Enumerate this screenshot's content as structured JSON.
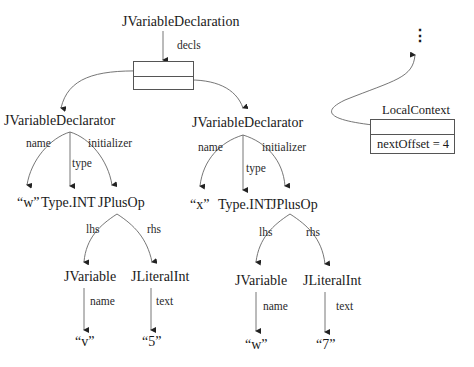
{
  "diagram": {
    "root": {
      "label": "JVariableDeclaration",
      "decls_edge": "decls"
    },
    "declarators": [
      {
        "label": "JVariableDeclarator",
        "edges": {
          "name": "name",
          "type": "type",
          "initializer": "initializer"
        },
        "name_value": "“w”",
        "type_value": "Type.INT",
        "initializer": {
          "label": "JPlusOp",
          "edges": {
            "lhs": "lhs",
            "rhs": "rhs"
          },
          "lhs": {
            "label": "JVariable",
            "edge": "name",
            "value": "“v”"
          },
          "rhs": {
            "label": "JLiteralInt",
            "edge": "text",
            "value": "“5”"
          }
        }
      },
      {
        "label": "JVariableDeclarator",
        "edges": {
          "name": "name",
          "type": "type",
          "initializer": "initializer"
        },
        "name_value": "“x”",
        "type_value": "Type.INT",
        "initializer": {
          "label": "JPlusOp",
          "edges": {
            "lhs": "lhs",
            "rhs": "rhs"
          },
          "lhs": {
            "label": "JVariable",
            "edge": "name",
            "value": "“w”"
          },
          "rhs": {
            "label": "JLiteralInt",
            "edge": "text",
            "value": "“7”"
          }
        }
      }
    ],
    "local_context": {
      "title": "LocalContext",
      "field": "nextOffset = 4",
      "parent_ellipsis": "⋮"
    }
  },
  "colors": {
    "line": "#555555",
    "text": "#1a1a1a",
    "background": "#ffffff"
  }
}
